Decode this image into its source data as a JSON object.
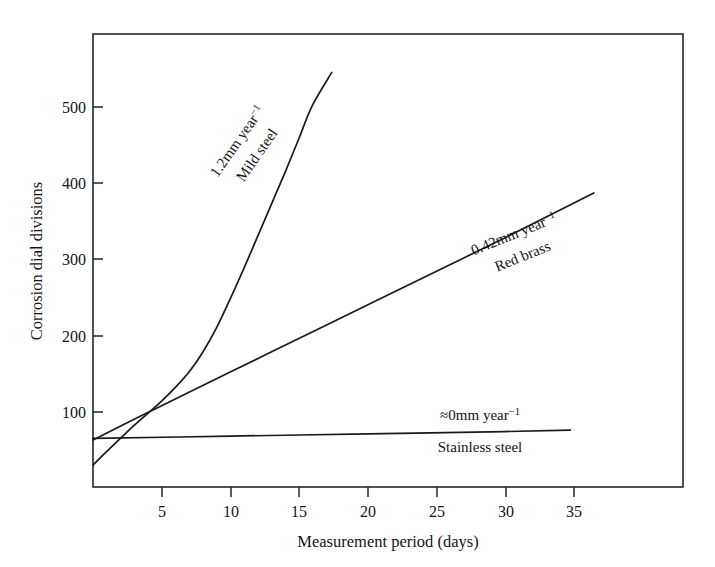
{
  "figure": {
    "background_color": "#ffffff",
    "ink_color": "#1a1a1a"
  },
  "chart_data": {
    "type": "line",
    "title": "",
    "subtitle": "",
    "xlabel": "Measurement period (days)",
    "ylabel": "Corrosion dial divisions",
    "xlim": [
      0,
      43
    ],
    "ylim": [
      0,
      595
    ],
    "xticks": [
      5,
      10,
      15,
      20,
      25,
      30,
      35
    ],
    "yticks": [
      100,
      200,
      300,
      400,
      500
    ],
    "xtick_labels": [
      "5",
      "10",
      "15",
      "20",
      "25",
      "30",
      "35"
    ],
    "ytick_labels": [
      "100",
      "200",
      "300",
      "400",
      "500"
    ],
    "grid": false,
    "legend": "inline-annotations",
    "frame": "full-box",
    "series": [
      {
        "name": "Mild steel",
        "rate_label": "1.2mm year",
        "rate_exponent": "−1",
        "annotation_angle_deg": -55,
        "x": [
          0,
          1,
          2,
          3,
          4,
          5,
          6,
          7,
          8,
          9,
          10,
          11,
          12,
          13,
          14,
          15,
          16,
          17.4
        ],
        "values": [
          30,
          48,
          65,
          82,
          98,
          114,
          132,
          152,
          178,
          210,
          248,
          288,
          330,
          372,
          414,
          458,
          502,
          545
        ]
      },
      {
        "name": "Red brass",
        "rate_label": "0.42mm year",
        "rate_exponent": "−1",
        "annotation_angle_deg": -22,
        "x": [
          0,
          5,
          10,
          15,
          20,
          25,
          30,
          36.5
        ],
        "values": [
          63,
          108,
          152,
          196,
          240,
          284,
          328,
          387
        ]
      },
      {
        "name": "Stainless steel",
        "rate_label": "≈0mm year",
        "rate_exponent": "−1",
        "annotation_angle_deg": 0,
        "x": [
          0,
          10,
          20,
          30,
          34.8
        ],
        "values": [
          65,
          68,
          71,
          74,
          76
        ]
      }
    ]
  },
  "annotations": {
    "mild_steel": {
      "rate": "1.2mm year",
      "exponent": "−1",
      "name": "Mild steel"
    },
    "red_brass": {
      "rate": "0.42mm year",
      "exponent": "−1",
      "name": "Red brass"
    },
    "stainless_steel": {
      "rate": "≈0mm year",
      "exponent": "−1",
      "name": "Stainless steel"
    }
  }
}
